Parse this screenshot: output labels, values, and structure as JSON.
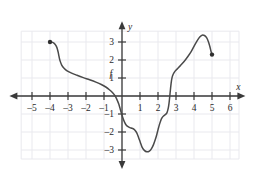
{
  "chart_data": {
    "type": "line",
    "title": "",
    "xlabel": "x",
    "ylabel": "y",
    "grid": true,
    "legend": null,
    "xlim": [
      -6.2,
      6.8
    ],
    "ylim": [
      -4.0,
      4.1
    ],
    "xticks": [
      -5,
      -4,
      -3,
      -2,
      -1,
      1,
      2,
      3,
      4,
      5,
      6
    ],
    "yticks": [
      3,
      2,
      1,
      -1,
      -2,
      -3
    ],
    "xtick_labels": [
      "–5",
      "–4",
      "–3",
      "–2",
      "–1",
      "1",
      "2",
      "3",
      "4",
      "5",
      "6"
    ],
    "ytick_labels": [
      "3",
      "2",
      "1",
      "–1",
      "–2",
      "–3"
    ],
    "grid_x_range": [
      -5.6,
      6.5
    ],
    "grid_y_range": [
      -3.5,
      3.6
    ],
    "curve_label": "f",
    "curve_label_point": [
      -0.62,
      1.08
    ],
    "series": [
      {
        "name": "f",
        "color": "#4a4a4a",
        "start_endpoint": {
          "x": -4.0,
          "y": 3.0,
          "style": "filled-dot"
        },
        "end_endpoint": {
          "x": 5.0,
          "y": 2.3,
          "style": "filled-dot"
        },
        "points": [
          [
            -4.0,
            3.0
          ],
          [
            -3.85,
            2.98
          ],
          [
            -3.72,
            2.88
          ],
          [
            -3.62,
            2.7
          ],
          [
            -3.55,
            2.45
          ],
          [
            -3.5,
            2.2
          ],
          [
            -3.44,
            1.95
          ],
          [
            -3.35,
            1.72
          ],
          [
            -3.22,
            1.54
          ],
          [
            -3.05,
            1.4
          ],
          [
            -2.8,
            1.27
          ],
          [
            -2.5,
            1.15
          ],
          [
            -2.15,
            1.02
          ],
          [
            -1.8,
            0.9
          ],
          [
            -1.45,
            0.77
          ],
          [
            -1.15,
            0.64
          ],
          [
            -0.9,
            0.5
          ],
          [
            -0.7,
            0.35
          ],
          [
            -0.52,
            0.18
          ],
          [
            -0.38,
            0.0
          ],
          [
            -0.28,
            -0.2
          ],
          [
            -0.18,
            -0.45
          ],
          [
            -0.1,
            -0.72
          ],
          [
            -0.02,
            -1.0
          ],
          [
            0.06,
            -1.25
          ],
          [
            0.14,
            -1.45
          ],
          [
            0.24,
            -1.62
          ],
          [
            0.36,
            -1.72
          ],
          [
            0.5,
            -1.78
          ],
          [
            0.62,
            -1.82
          ],
          [
            0.72,
            -1.9
          ],
          [
            0.82,
            -2.05
          ],
          [
            0.92,
            -2.3
          ],
          [
            1.02,
            -2.58
          ],
          [
            1.12,
            -2.85
          ],
          [
            1.24,
            -3.02
          ],
          [
            1.38,
            -3.1
          ],
          [
            1.52,
            -3.06
          ],
          [
            1.64,
            -2.92
          ],
          [
            1.75,
            -2.7
          ],
          [
            1.85,
            -2.42
          ],
          [
            1.93,
            -2.15
          ],
          [
            2.0,
            -1.88
          ],
          [
            2.07,
            -1.62
          ],
          [
            2.14,
            -1.4
          ],
          [
            2.22,
            -1.22
          ],
          [
            2.32,
            -1.1
          ],
          [
            2.42,
            -1.02
          ],
          [
            2.5,
            -0.92
          ],
          [
            2.56,
            -0.72
          ],
          [
            2.61,
            -0.42
          ],
          [
            2.65,
            -0.05
          ],
          [
            2.69,
            0.35
          ],
          [
            2.73,
            0.72
          ],
          [
            2.78,
            1.02
          ],
          [
            2.85,
            1.22
          ],
          [
            2.95,
            1.38
          ],
          [
            3.08,
            1.52
          ],
          [
            3.25,
            1.7
          ],
          [
            3.45,
            1.92
          ],
          [
            3.65,
            2.18
          ],
          [
            3.85,
            2.48
          ],
          [
            4.02,
            2.8
          ],
          [
            4.18,
            3.08
          ],
          [
            4.32,
            3.28
          ],
          [
            4.45,
            3.38
          ],
          [
            4.58,
            3.36
          ],
          [
            4.7,
            3.24
          ],
          [
            4.8,
            3.02
          ],
          [
            4.88,
            2.75
          ],
          [
            4.94,
            2.5
          ],
          [
            5.0,
            2.3
          ]
        ]
      }
    ]
  },
  "axes": {
    "x_axis_name": "x",
    "y_axis_name": "y"
  },
  "colors": {
    "curve": "#4a4a4a",
    "axis": "#3a3a3a",
    "grid": "#e9e9ee",
    "text": "#2b2b2b",
    "background": "#ffffff"
  }
}
